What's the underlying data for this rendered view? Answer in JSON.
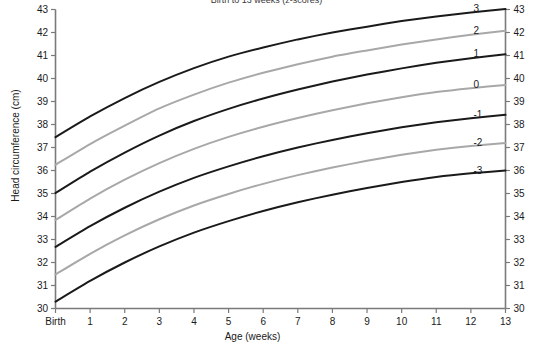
{
  "chart_data": {
    "type": "line",
    "title": "Birth to 13 weeks (z-scores)",
    "xlabel": "Age (weeks)",
    "ylabel": "Head circumference (cm)",
    "xlim": [
      0,
      13
    ],
    "ylim": [
      30,
      43
    ],
    "grid": false,
    "legend_position": "right-inline-labels",
    "x": [
      0,
      1,
      2,
      3,
      4,
      5,
      6,
      7,
      8,
      9,
      10,
      11,
      12,
      13
    ],
    "x_tick_labels": [
      "Birth",
      "1",
      "2",
      "3",
      "4",
      "5",
      "6",
      "7",
      "8",
      "9",
      "10",
      "11",
      "12",
      "13"
    ],
    "y_tick_labels": [
      "30",
      "31",
      "32",
      "33",
      "34",
      "35",
      "36",
      "37",
      "38",
      "39",
      "40",
      "41",
      "42",
      "43"
    ],
    "y_tick_labels_right": [
      "30",
      "31",
      "32",
      "33",
      "34",
      "35",
      "36",
      "37",
      "38",
      "39",
      "40",
      "41",
      "42",
      "43"
    ],
    "z_labels": [
      "3",
      "2",
      "1",
      "0",
      "-1",
      "-2",
      "-3"
    ],
    "series": [
      {
        "name": "3",
        "color": "#1a1a1a",
        "values": [
          37.45,
          38.35,
          39.15,
          39.85,
          40.45,
          40.95,
          41.35,
          41.7,
          42.0,
          42.25,
          42.5,
          42.7,
          42.87,
          43.02
        ]
      },
      {
        "name": "2",
        "color": "#a8a8a8",
        "values": [
          36.25,
          37.15,
          37.95,
          38.7,
          39.3,
          39.82,
          40.25,
          40.62,
          40.95,
          41.22,
          41.48,
          41.7,
          41.9,
          42.08
        ]
      },
      {
        "name": "1",
        "color": "#1a1a1a",
        "values": [
          35.02,
          35.95,
          36.78,
          37.52,
          38.15,
          38.68,
          39.13,
          39.52,
          39.87,
          40.17,
          40.44,
          40.68,
          40.88,
          41.05
        ]
      },
      {
        "name": "0",
        "color": "#a8a8a8",
        "values": [
          33.85,
          34.78,
          35.6,
          36.32,
          36.94,
          37.46,
          37.9,
          38.28,
          38.62,
          38.92,
          39.18,
          39.41,
          39.58,
          39.72
        ]
      },
      {
        "name": "-1",
        "color": "#1a1a1a",
        "values": [
          32.68,
          33.58,
          34.38,
          35.08,
          35.68,
          36.18,
          36.62,
          37.0,
          37.33,
          37.62,
          37.88,
          38.1,
          38.27,
          38.42
        ]
      },
      {
        "name": "-2",
        "color": "#a8a8a8",
        "values": [
          31.48,
          32.38,
          33.18,
          33.88,
          34.48,
          34.98,
          35.42,
          35.8,
          36.13,
          36.42,
          36.68,
          36.9,
          37.07,
          37.2
        ]
      },
      {
        "name": "-3",
        "color": "#1a1a1a",
        "values": [
          30.3,
          31.2,
          32.0,
          32.7,
          33.3,
          33.8,
          34.24,
          34.62,
          34.95,
          35.24,
          35.5,
          35.72,
          35.88,
          36.0
        ]
      }
    ]
  }
}
